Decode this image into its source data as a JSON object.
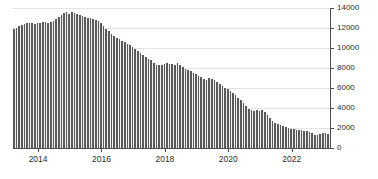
{
  "chart_data": {
    "type": "bar",
    "title": "",
    "subtitle": "",
    "xlabel": "",
    "ylabel": "",
    "ylim": [
      0,
      14000
    ],
    "y_ticks": [
      0,
      2000,
      4000,
      6000,
      8000,
      10000,
      12000,
      14000
    ],
    "y_tick_labels": [
      "0",
      "2000",
      "4000",
      "6000",
      "8000",
      "10000",
      "12000",
      "14000"
    ],
    "y_axis_position": "right",
    "x_tick_labels": [
      "2014",
      "2016",
      "2018",
      "2020",
      "2022"
    ],
    "x_tick_years": [
      2014,
      2016,
      2018,
      2020,
      2022
    ],
    "xlim": [
      "2013-04",
      "2023-03"
    ],
    "grid": true,
    "legend": null,
    "bar_color": "#595959",
    "grid_color": "#e3e3e3",
    "axis_color": "#4d4d4d",
    "frequency": "monthly",
    "categories": [
      "2013-04",
      "2013-05",
      "2013-06",
      "2013-07",
      "2013-08",
      "2013-09",
      "2013-10",
      "2013-11",
      "2013-12",
      "2014-01",
      "2014-02",
      "2014-03",
      "2014-04",
      "2014-05",
      "2014-06",
      "2014-07",
      "2014-08",
      "2014-09",
      "2014-10",
      "2014-11",
      "2014-12",
      "2015-01",
      "2015-02",
      "2015-03",
      "2015-04",
      "2015-05",
      "2015-06",
      "2015-07",
      "2015-08",
      "2015-09",
      "2015-10",
      "2015-11",
      "2015-12",
      "2016-01",
      "2016-02",
      "2016-03",
      "2016-04",
      "2016-05",
      "2016-06",
      "2016-07",
      "2016-08",
      "2016-09",
      "2016-10",
      "2016-11",
      "2016-12",
      "2017-01",
      "2017-02",
      "2017-03",
      "2017-04",
      "2017-05",
      "2017-06",
      "2017-07",
      "2017-08",
      "2017-09",
      "2017-10",
      "2017-11",
      "2017-12",
      "2018-01",
      "2018-02",
      "2018-03",
      "2018-04",
      "2018-05",
      "2018-06",
      "2018-07",
      "2018-08",
      "2018-09",
      "2018-10",
      "2018-11",
      "2018-12",
      "2019-01",
      "2019-02",
      "2019-03",
      "2019-04",
      "2019-05",
      "2019-06",
      "2019-07",
      "2019-08",
      "2019-09",
      "2019-10",
      "2019-11",
      "2019-12",
      "2020-01",
      "2020-02",
      "2020-03",
      "2020-04",
      "2020-05",
      "2020-06",
      "2020-07",
      "2020-08",
      "2020-09",
      "2020-10",
      "2020-11",
      "2020-12",
      "2021-01",
      "2021-02",
      "2021-03",
      "2021-04",
      "2021-05",
      "2021-06",
      "2021-07",
      "2021-08",
      "2021-09",
      "2021-10",
      "2021-11",
      "2021-12",
      "2022-01",
      "2022-02",
      "2022-03",
      "2022-04",
      "2022-05",
      "2022-06",
      "2022-07",
      "2022-08",
      "2022-09",
      "2022-10",
      "2022-11",
      "2022-12",
      "2023-01",
      "2023-02",
      "2023-03"
    ],
    "values": [
      11900,
      12050,
      12250,
      12350,
      12450,
      12500,
      12550,
      12500,
      12450,
      12500,
      12550,
      12600,
      12600,
      12550,
      12600,
      12700,
      12900,
      13150,
      13350,
      13500,
      13600,
      13450,
      13600,
      13550,
      13400,
      13350,
      13250,
      13150,
      13050,
      13000,
      12950,
      12850,
      12700,
      12500,
      12250,
      11950,
      11700,
      11450,
      11250,
      11050,
      10900,
      10750,
      10600,
      10450,
      10300,
      10100,
      9900,
      9700,
      9500,
      9300,
      9100,
      8950,
      8800,
      8500,
      8350,
      8300,
      8350,
      8400,
      8500,
      8450,
      8400,
      8350,
      8500,
      8300,
      8100,
      7950,
      7800,
      7700,
      7550,
      7400,
      7250,
      7100,
      6900,
      6800,
      7000,
      6950,
      6800,
      6600,
      6450,
      6250,
      6050,
      5900,
      5700,
      5500,
      5300,
      5050,
      4800,
      4500,
      4200,
      3950,
      3800,
      3750,
      3800,
      3700,
      3800,
      3600,
      3300,
      3000,
      2750,
      2550,
      2400,
      2300,
      2200,
      2100,
      2000,
      1950,
      1900,
      1850,
      1800,
      1800,
      1750,
      1700,
      1650,
      1500,
      1350,
      1300,
      1450,
      1550,
      1500,
      1400
    ]
  }
}
